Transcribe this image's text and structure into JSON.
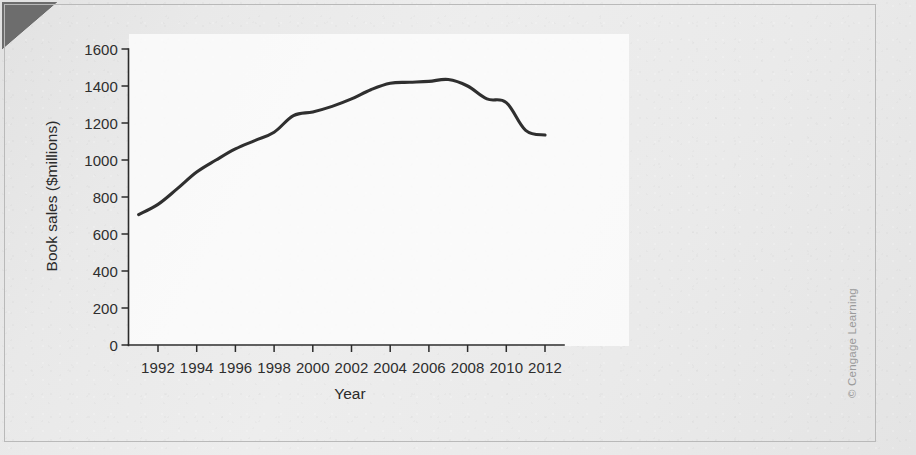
{
  "figure": {
    "credit": "© Cengage Learning",
    "corner_marker": "corner-wedge"
  },
  "chart_data": {
    "type": "line",
    "title": "",
    "xlabel": "Year",
    "ylabel": "Book sales ($millions)",
    "xlim": [
      1991,
      2012
    ],
    "ylim": [
      0,
      1600
    ],
    "grid": false,
    "legend": null,
    "line_color": "#2f2f2f",
    "x_ticks": [
      1992,
      1994,
      1996,
      1998,
      2000,
      2002,
      2004,
      2006,
      2008,
      2010,
      2012
    ],
    "y_ticks": [
      0,
      200,
      400,
      600,
      800,
      1000,
      1200,
      1400,
      1600
    ],
    "x": [
      1991,
      1992,
      1993,
      1994,
      1995,
      1996,
      1997,
      1998,
      1999,
      2000,
      2001,
      2002,
      2003,
      2004,
      2005,
      2006,
      2007,
      2008,
      2009,
      2010,
      2011,
      2012
    ],
    "values": [
      705,
      760,
      845,
      935,
      1000,
      1060,
      1105,
      1150,
      1240,
      1260,
      1290,
      1330,
      1380,
      1415,
      1420,
      1425,
      1435,
      1400,
      1330,
      1310,
      1160,
      1135
    ],
    "series": [
      {
        "name": "Book sales",
        "values": [
          705,
          760,
          845,
          935,
          1000,
          1060,
          1105,
          1150,
          1240,
          1260,
          1290,
          1330,
          1380,
          1415,
          1420,
          1425,
          1435,
          1400,
          1330,
          1310,
          1160,
          1135
        ]
      }
    ]
  }
}
